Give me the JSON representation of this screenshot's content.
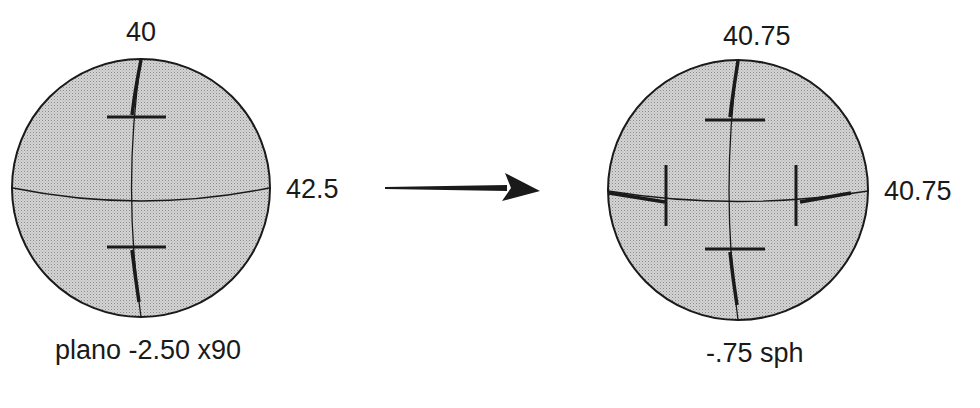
{
  "left_sphere": {
    "top_label": "40",
    "right_label": "42.5",
    "caption": "plano -2.50 x90"
  },
  "right_sphere": {
    "top_label": "40.75",
    "right_label": "40.75",
    "caption": "-.75 sph"
  },
  "colors": {
    "fill": "#c9c9c9",
    "stroke": "#1a1a1a",
    "background": "#ffffff"
  }
}
